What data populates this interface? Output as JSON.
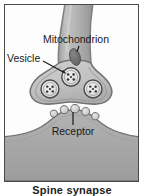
{
  "figure": {
    "caption": "Spine synapse",
    "panel": {
      "border_color": "#4a4a4a",
      "background_color": "#fdfdfd"
    },
    "labels": {
      "mitochondrion": "Mitochondrion",
      "vesicle": "Vesicle",
      "receptor": "Receptor"
    },
    "colors": {
      "axon_fill": "#b6b6b6",
      "axon_membrane": "#8e8e8e",
      "terminal_fill": "#c9c9c9",
      "terminal_membrane": "#7d7d7d",
      "vesicle_fill": "#e2e2e2",
      "vesicle_ring": "#4d4d4d",
      "transmitter_dot": "#2f2f2f",
      "mitochondrion_fill": "#6f6f6f",
      "dendrite_fill": "#a9a9a9",
      "dendrite_edge": "#777777",
      "receptor_fill": "#d5d5d5",
      "receptor_edge": "#6b6b6b",
      "label_text": "#1a1a1a",
      "leader_line": "#1a1a1a"
    },
    "structures": {
      "axon": "presynaptic axon",
      "axon_terminal": "presynaptic terminal bouton",
      "synaptic_cleft": "synaptic cleft",
      "dendritic_spine": "postsynaptic dendritic spine"
    },
    "vesicle_count": 3,
    "receptor_count": 5
  }
}
